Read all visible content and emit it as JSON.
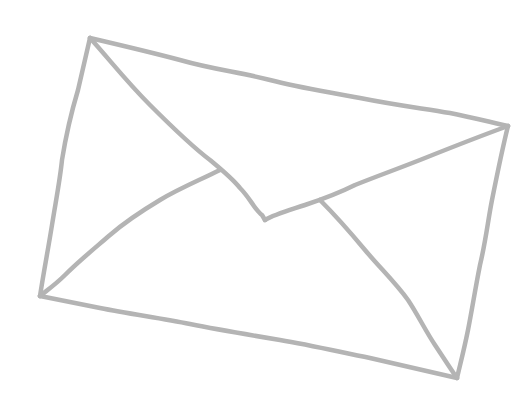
{
  "image": {
    "subject": "hand-drawn envelope sketch",
    "background_color": "#ffffff",
    "line_color": "#b4b4b4"
  }
}
